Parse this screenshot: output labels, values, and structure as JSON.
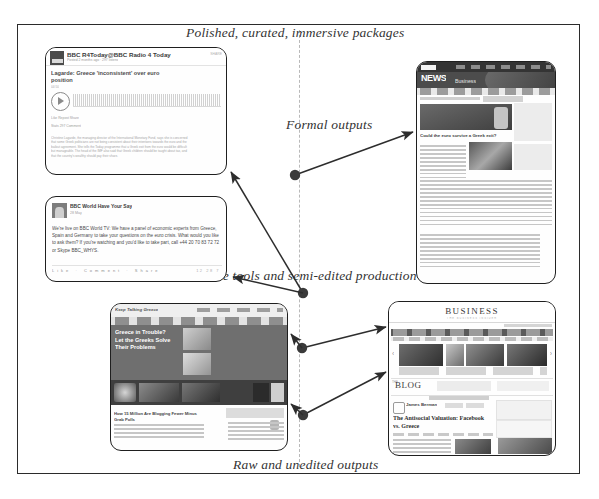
{
  "figure": {
    "captions": {
      "top": "Polished, curated, immersive packages",
      "formal": "Formal outputs",
      "live": "Live tools and semi-edited production",
      "bottom": "Raw and unedited outputs"
    }
  },
  "cards": {
    "soundcloud": {
      "name": "BBC R4Today@BBC Radio 4 Today",
      "subtitle": "Posted 2 months ago · 297 listens",
      "corner": "SHARE",
      "headline": "Lagarde: Greece 'inconsistent' over euro position",
      "duration": "04:50",
      "meta": "Like    Repost    Share",
      "meta2": "Stats     297     Comment",
      "body": "Christine Lagarde, the managing director of the International Monetary Fund, says she is concerned that some Greek politicians are not being consistent about their intentions towards the euro and the bailout agreement. She tells the Today programme that a Greek exit from the euro would be difficult but manageable. The head of the IMF also said that Greek children should be taught about tax, and that the country's wealthy should pay their share."
    },
    "facebook": {
      "page": "BBC World Have Your Say",
      "date": "28 May",
      "post": "We're live on BBC World TV: We have a panel of economic experts from Greece, Spain and Germany to take your questions on the euro crisis. What would you like to ask them? If you're watching and you'd like to take part, call +44 20 70 83 72 72 or Skype BBC_WHYS.",
      "actions": "Like · Comment · Share",
      "reactions": "12  28  7"
    },
    "bbcnews": {
      "brand": "BBC",
      "section": "NEWS",
      "subsection": "Business",
      "headline": "Could the euro survive a Greek exit?",
      "sidebar_title": "Top Stories",
      "sidebar_title2": "Features & Analysis",
      "market": "FTSE"
    },
    "greeceblog": {
      "masthead": "Keep Talking Greece",
      "hero_title": "Greece in Trouble? Let the Greeks Solve Their Problems",
      "article": "How 15 Million Are Blogging Fewer Minus Grab Polls"
    },
    "business": {
      "masthead": "BUSINESS",
      "tagline": "THE BUSINESS INSIDER",
      "blog_label": "BLOG",
      "blog_prefix": "THE",
      "author": "James Berman",
      "headline": "The Antisocial Valuation: Facebook vs. Greece",
      "sidebar_note": "Latest new budgets have latest feeds and Menu",
      "arrow_prev": "‹",
      "arrow_next": "›"
    }
  },
  "colors": {
    "frame": "#2b2b2b",
    "spine": "#b9b9b9",
    "arrow": "#2d2d2d",
    "caption": "#333333"
  }
}
